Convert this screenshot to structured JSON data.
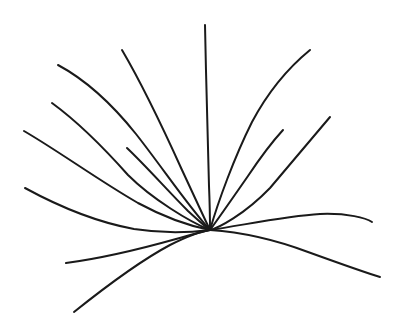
{
  "artwork": {
    "title": "Radiating Curved Strands Line Drawing",
    "description": "Hand-drawn black ink sketch of about fourteen slender curved strands fanning out from a single convergence point, resembling a tuft of grass or a sparse plant spray.",
    "medium": "pen-and-ink line drawing",
    "subject": "grass-tuft-spray",
    "canvas": {
      "width": 404,
      "height": 335,
      "background_color": "#ffffff"
    },
    "style": {
      "stroke_color": "#1a1a1a",
      "stroke_width": 2.0,
      "stroke_linecap": "round",
      "fill": "none",
      "hand_drawn": true
    },
    "convergence_point": {
      "x": 210,
      "y": 230
    },
    "stroke_count": 14,
    "strokes": [
      {
        "name": "strand-far-left-upper",
        "tip": {
          "x": 24,
          "y": 131
        },
        "width": 2.0,
        "path": "M24,131 C60,152 98,180 138,203 C162,216 190,226 210,230"
      },
      {
        "name": "strand-upper-left-long",
        "tip": {
          "x": 58,
          "y": 65
        },
        "width": 2.0,
        "path": "M58,65 C86,80 112,104 136,134 C162,167 188,206 210,230"
      },
      {
        "name": "strand-upper-left-mid",
        "tip": {
          "x": 52,
          "y": 103
        },
        "width": 2.0,
        "path": "M52,103 C78,122 104,148 128,175 C152,199 190,222 210,230"
      },
      {
        "name": "strand-left-shallow",
        "tip": {
          "x": 25,
          "y": 188
        },
        "width": 2.0,
        "path": "M25,188 C58,206 96,222 134,229 C166,234 194,232 210,230"
      },
      {
        "name": "strand-lower-left-flat",
        "tip": {
          "x": 66,
          "y": 263
        },
        "width": 2.0,
        "path": "M66,263 C104,258 144,248 176,239 C194,234 204,231 210,230"
      },
      {
        "name": "strand-lower-left-sweep",
        "tip": {
          "x": 74,
          "y": 312
        },
        "width": 2.0,
        "path": "M74,312 C104,288 138,262 170,245 C190,235 203,231 210,230"
      },
      {
        "name": "strand-center-steep-left",
        "tip": {
          "x": 122,
          "y": 50
        },
        "width": 2.0,
        "path": "M122,50 C142,84 163,128 182,170 C196,200 206,222 210,230"
      },
      {
        "name": "strand-short-inner-left",
        "tip": {
          "x": 127,
          "y": 148
        },
        "width": 2.0,
        "path": "M127,148 C146,166 168,191 188,211 C200,222 207,228 210,230"
      },
      {
        "name": "strand-vertical-tall",
        "tip": {
          "x": 205,
          "y": 25
        },
        "width": 2.0,
        "path": "M205,25 C206,80 208,140 209,186 C210,210 210,224 210,230"
      },
      {
        "name": "strand-upper-right-long",
        "tip": {
          "x": 310,
          "y": 50
        },
        "width": 2.0,
        "path": "M310,50 C288,68 268,92 252,122 C234,158 218,202 210,230"
      },
      {
        "name": "strand-right-mid-short",
        "tip": {
          "x": 283,
          "y": 130
        },
        "width": 2.0,
        "path": "M283,130 C272,142 260,158 248,176 C232,199 216,222 210,230"
      },
      {
        "name": "strand-right-diagonal",
        "tip": {
          "x": 330,
          "y": 117
        },
        "width": 2.0,
        "path": "M330,117 C312,138 292,162 270,188 C244,215 218,228 210,230"
      },
      {
        "name": "strand-right-flat-arc",
        "tip": {
          "x": 372,
          "y": 222
        },
        "width": 2.0,
        "path": "M210,230 C244,225 286,216 320,214 C348,213 366,218 372,222"
      },
      {
        "name": "strand-right-bottom-sweep",
        "tip": {
          "x": 380,
          "y": 277
        },
        "width": 2.0,
        "path": "M210,230 C240,232 276,240 308,252 C344,265 370,274 380,277"
      }
    ]
  }
}
